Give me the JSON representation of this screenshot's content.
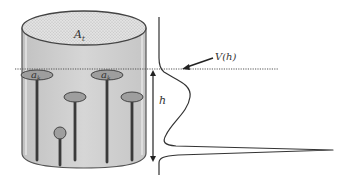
{
  "diagram": {
    "labels": {
      "top_area": "A",
      "top_area_sub": "t",
      "pore_area_1": "a",
      "pore_area_1_sub": "k",
      "pore_area_2": "a",
      "pore_area_2_sub": "k",
      "height": "h",
      "volume_function": "V(h)"
    },
    "colors": {
      "cylinder_fill": "#cfcfcf",
      "cylinder_top_fill": "#dedede",
      "outline": "#444444",
      "pore_fill": "#9e9e9e",
      "stem": "#3a3a3a",
      "curve": "#333333",
      "dotted_line": "#555555"
    }
  }
}
